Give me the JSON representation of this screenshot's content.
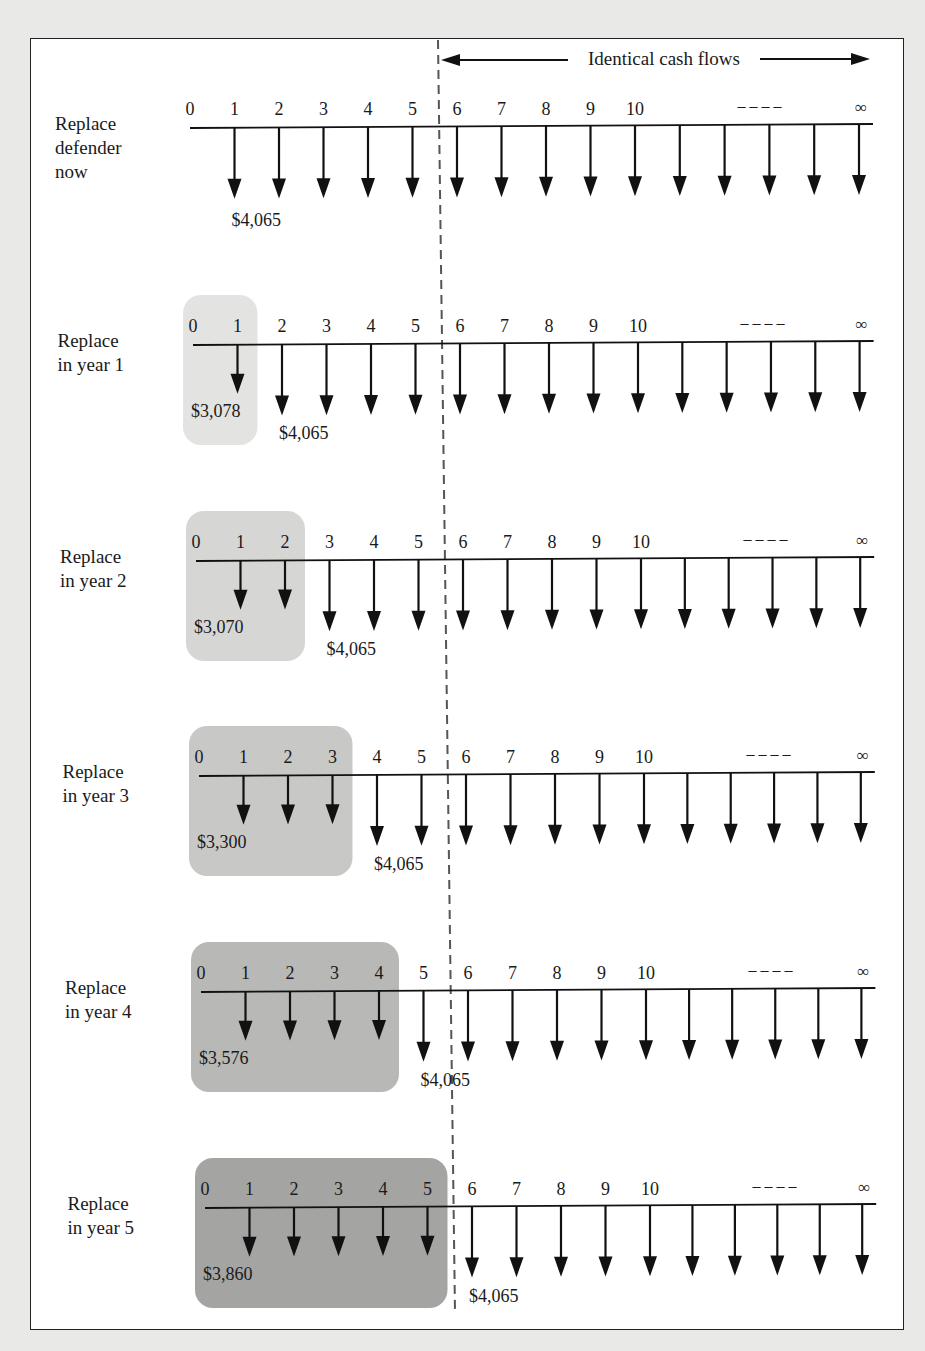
{
  "header": {
    "identical_label": "Identical cash flows"
  },
  "axis": {
    "ticks": [
      "0",
      "1",
      "2",
      "3",
      "4",
      "5",
      "6",
      "7",
      "8",
      "9",
      "10"
    ],
    "ellipsis": "– – – –",
    "infinity": "∞"
  },
  "colors": {
    "line": "#111111",
    "dashed": "#555555",
    "box_shades": [
      "#e3e3e1",
      "#d6d6d4",
      "#c8c8c6",
      "#b8b8b6",
      "#a4a4a2"
    ]
  },
  "rows": [
    {
      "label": "Replace\ndefender\nnow",
      "replace_year": 0,
      "challenger_label": "",
      "defender_label": "$4,065"
    },
    {
      "label": "Replace\nin year 1",
      "replace_year": 1,
      "challenger_label": "$3,078",
      "defender_label": "$4,065"
    },
    {
      "label": "Replace\nin year 2",
      "replace_year": 2,
      "challenger_label": "$3,070",
      "defender_label": "$4,065"
    },
    {
      "label": "Replace\nin year 3",
      "replace_year": 3,
      "challenger_label": "$3,300",
      "defender_label": "$4,065"
    },
    {
      "label": "Replace\nin year 4",
      "replace_year": 4,
      "challenger_label": "$3,576",
      "defender_label": "$4,065"
    },
    {
      "label": "Replace\nin year 5",
      "replace_year": 5,
      "challenger_label": "$3,860",
      "defender_label": "$4,065"
    }
  ],
  "chart_data": {
    "type": "cash-flow-diagram",
    "annotation": "Identical cash flows (year 6 onward)",
    "periods": [
      "0",
      "1",
      "2",
      "3",
      "4",
      "5",
      "6",
      "7",
      "8",
      "9",
      "10",
      "...",
      "∞"
    ],
    "series": [
      {
        "name": "Replace defender now",
        "annual_cost_years_1_to_inf": 4065
      },
      {
        "name": "Replace in year 1",
        "defender_cost_years_1_to_1": 3078,
        "challenger_cost_after": 4065
      },
      {
        "name": "Replace in year 2",
        "defender_cost_years_1_to_2": 3070,
        "challenger_cost_after": 4065
      },
      {
        "name": "Replace in year 3",
        "defender_cost_years_1_to_3": 3300,
        "challenger_cost_after": 4065
      },
      {
        "name": "Replace in year 4",
        "defender_cost_years_1_to_4": 3576,
        "challenger_cost_after": 4065
      },
      {
        "name": "Replace in year 5",
        "defender_cost_years_1_to_5": 3860,
        "challenger_cost_after": 4065
      }
    ]
  }
}
